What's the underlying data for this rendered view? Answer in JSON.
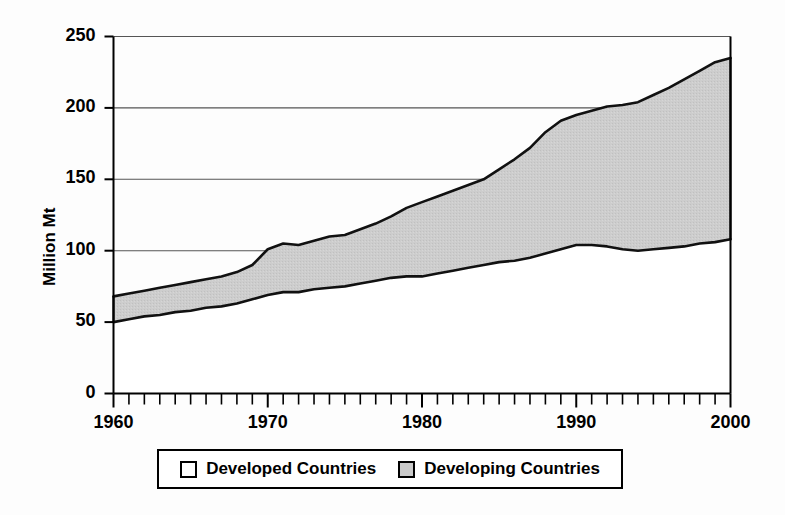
{
  "chart_data": {
    "type": "area",
    "title": "",
    "subtitle": "",
    "xlabel": "",
    "ylabel": "Million Mt",
    "xlim": [
      1960,
      2000
    ],
    "ylim": [
      0,
      250
    ],
    "grid": true,
    "stacked": true,
    "legend_position": "bottom",
    "yticks": [
      0,
      50,
      100,
      150,
      200,
      250
    ],
    "ytick_labels": [
      "0",
      "50",
      "100",
      "150",
      "200",
      "250"
    ],
    "xticks": [
      1960,
      1970,
      1980,
      1990,
      2000
    ],
    "xtick_labels": [
      "1960",
      "1970",
      "1980",
      "1990",
      "2000"
    ],
    "x_minor_tick_interval": 1,
    "x": [
      1960,
      1961,
      1962,
      1963,
      1964,
      1965,
      1966,
      1967,
      1968,
      1969,
      1970,
      1971,
      1972,
      1973,
      1974,
      1975,
      1976,
      1977,
      1978,
      1979,
      1980,
      1981,
      1982,
      1983,
      1984,
      1985,
      1986,
      1987,
      1988,
      1989,
      1990,
      1991,
      1992,
      1993,
      1994,
      1995,
      1996,
      1997,
      1998,
      1999,
      2000
    ],
    "series": [
      {
        "name": "Developed Countries",
        "fill": "#ffffff",
        "values": [
          50,
          52,
          54,
          55,
          57,
          58,
          60,
          61,
          63,
          66,
          69,
          71,
          71,
          73,
          74,
          75,
          77,
          79,
          81,
          82,
          82,
          84,
          86,
          88,
          90,
          92,
          93,
          95,
          98,
          101,
          104,
          104,
          103,
          101,
          100,
          101,
          102,
          103,
          105,
          106,
          108
        ]
      },
      {
        "name": "Developing Countries",
        "fill": "#c9c9c9",
        "values": [
          18,
          18,
          18,
          19,
          19,
          20,
          20,
          21,
          22,
          24,
          32,
          34,
          33,
          34,
          36,
          36,
          38,
          40,
          43,
          48,
          52,
          54,
          56,
          58,
          60,
          65,
          71,
          77,
          85,
          90,
          91,
          94,
          98,
          101,
          104,
          108,
          112,
          117,
          121,
          126,
          127
        ]
      }
    ],
    "totals": [
      68,
      70,
      72,
      74,
      76,
      78,
      80,
      82,
      85,
      90,
      101,
      105,
      104,
      107,
      110,
      111,
      115,
      119,
      124,
      130,
      134,
      138,
      142,
      146,
      150,
      157,
      164,
      172,
      183,
      191,
      195,
      198,
      201,
      202,
      204,
      209,
      214,
      220,
      226,
      232,
      235
    ]
  },
  "legend": {
    "items": [
      {
        "label": "Developed Countries",
        "swatch_color": "#ffffff"
      },
      {
        "label": "Developing Countries",
        "swatch_color": "#c9c9c9"
      }
    ]
  },
  "colors": {
    "axis": "#000000",
    "grid": "#555555",
    "curve": "#111111",
    "developed_fill": "#ffffff",
    "developing_fill": "#c9c9c9",
    "background": "#fdfdfd"
  }
}
